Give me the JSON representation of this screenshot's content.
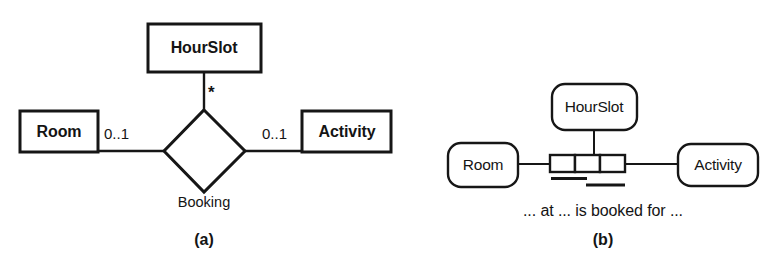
{
  "figure": {
    "background_color": "#ffffff",
    "line_color": "#161616",
    "fill_color": "#ffffff",
    "panels": [
      {
        "id": "panel-a",
        "caption": "(a)",
        "notation": "ER / UML class diagram",
        "entities": [
          {
            "name": "HourSlot",
            "shape": "rectangle",
            "position": "top"
          },
          {
            "name": "Room",
            "shape": "rectangle",
            "position": "left"
          },
          {
            "name": "Activity",
            "shape": "rectangle",
            "position": "right"
          }
        ],
        "relationship": {
          "name": "Booking",
          "shape": "diamond"
        },
        "multiplicities": [
          {
            "label": "*",
            "near": "HourSlot",
            "side": "top"
          },
          {
            "label": "0..1",
            "near": "Room",
            "side": "left"
          },
          {
            "label": "0..1",
            "near": "Activity",
            "side": "right"
          }
        ]
      },
      {
        "id": "panel-b",
        "caption": "(b)",
        "notation": "ORM / fact-based diagram",
        "entities": [
          {
            "name": "HourSlot",
            "shape": "rounded-rectangle",
            "position": "top"
          },
          {
            "name": "Room",
            "shape": "rounded-rectangle",
            "position": "left"
          },
          {
            "name": "Activity",
            "shape": "rounded-rectangle",
            "position": "right"
          }
        ],
        "fact_type": {
          "role_count": 3,
          "uniqueness_constraints": [
            {
              "spans_roles": "1-2"
            },
            {
              "spans_roles": "2-3"
            }
          ]
        },
        "predicate_reading": "... at ... is booked for ..."
      }
    ]
  }
}
